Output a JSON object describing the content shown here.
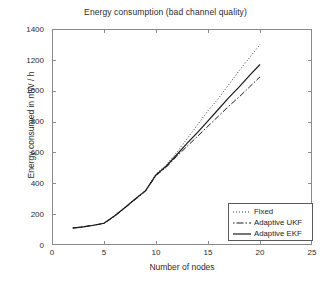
{
  "chart_data": {
    "type": "line",
    "title": "Energy consumption (bad channel quality)",
    "xlabel": "Number of nodes",
    "ylabel": "Energy consumed in mW / h",
    "xlim": [
      0,
      25
    ],
    "ylim": [
      0,
      1400
    ],
    "xticks": [
      0,
      5,
      10,
      15,
      20,
      25
    ],
    "yticks": [
      0,
      200,
      400,
      600,
      800,
      1000,
      1200,
      1400
    ],
    "grid": false,
    "legend_position": "lower right",
    "x": [
      2,
      3,
      4,
      5,
      6,
      7,
      8,
      9,
      10,
      11,
      12,
      13,
      14,
      15,
      16,
      17,
      18,
      19,
      20
    ],
    "series": [
      {
        "name": "Fixed",
        "style": "dotted",
        "color": "#333333",
        "values": [
          110,
          118,
          128,
          142,
          190,
          245,
          300,
          355,
          460,
          520,
          600,
          690,
          780,
          870,
          950,
          1040,
          1130,
          1215,
          1300
        ]
      },
      {
        "name": "Adaptive UKF",
        "style": "dash-dot",
        "color": "#1a1a1a",
        "values": [
          110,
          118,
          128,
          140,
          185,
          240,
          295,
          350,
          450,
          505,
          575,
          640,
          705,
          770,
          835,
          900,
          960,
          1025,
          1090
        ]
      },
      {
        "name": "Adaptive EKF",
        "style": "solid",
        "color": "#1a1a1a",
        "values": [
          110,
          118,
          128,
          141,
          188,
          242,
          298,
          352,
          455,
          512,
          585,
          660,
          730,
          805,
          880,
          955,
          1025,
          1100,
          1170
        ]
      }
    ]
  },
  "legend": {
    "items": [
      {
        "label": "Fixed",
        "icon": "dotted-line-icon"
      },
      {
        "label": "Adaptive UKF",
        "icon": "dash-dot-line-icon"
      },
      {
        "label": "Adaptive EKF",
        "icon": "solid-line-icon"
      }
    ]
  },
  "axis_tick_labels": {
    "y": [
      "1400",
      "1200",
      "1000",
      "800",
      "600",
      "400",
      "200",
      "0"
    ],
    "x": [
      "0",
      "5",
      "10",
      "15",
      "20",
      "25"
    ]
  }
}
